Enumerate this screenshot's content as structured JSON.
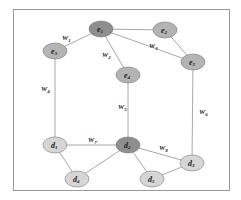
{
  "frame": {
    "x": 13,
    "y": 9,
    "width": 216,
    "height": 181,
    "stroke": "#9a9a9a"
  },
  "colors": {
    "edge": "#a8a8a8",
    "node_dark": "#8e8e8e",
    "node_medium": "#b4b4b4",
    "node_light": "#d6d6d6",
    "node_stroke": "#7a7a7a"
  },
  "nodes": [
    {
      "id": "e1",
      "base": "e",
      "sub": "1",
      "x": 101,
      "y": 29,
      "shade": "dark"
    },
    {
      "id": "e2",
      "base": "e",
      "sub": "2",
      "x": 165,
      "y": 30,
      "shade": "medium"
    },
    {
      "id": "e3",
      "base": "e",
      "sub": "3",
      "x": 55,
      "y": 51,
      "shade": "medium"
    },
    {
      "id": "e4",
      "base": "e",
      "sub": "4",
      "x": 128,
      "y": 75,
      "shade": "medium"
    },
    {
      "id": "e5",
      "base": "e",
      "sub": "5",
      "x": 193,
      "y": 62,
      "shade": "medium"
    },
    {
      "id": "d1",
      "base": "d",
      "sub": "1",
      "x": 55,
      "y": 145,
      "shade": "light"
    },
    {
      "id": "d2",
      "base": "d",
      "sub": "2",
      "x": 128,
      "y": 145,
      "shade": "dark"
    },
    {
      "id": "d3",
      "base": "d",
      "sub": "3",
      "x": 192,
      "y": 163,
      "shade": "light"
    },
    {
      "id": "d4",
      "base": "d",
      "sub": "4",
      "x": 77,
      "y": 179,
      "shade": "light"
    },
    {
      "id": "d5",
      "base": "d",
      "sub": "5",
      "x": 152,
      "y": 179,
      "shade": "light"
    }
  ],
  "edges": [
    {
      "from": "e1",
      "to": "e2",
      "label": null
    },
    {
      "from": "e1",
      "to": "e3",
      "label": {
        "base": "W",
        "sub": "1",
        "x": 62,
        "y": 40
      }
    },
    {
      "from": "e1",
      "to": "e4",
      "label": {
        "base": "W",
        "sub": "2",
        "x": 102,
        "y": 57
      }
    },
    {
      "from": "e1",
      "to": "e5",
      "label": {
        "base": "W",
        "sub": "3",
        "x": 149,
        "y": 48
      }
    },
    {
      "from": "e2",
      "to": "e5",
      "label": null
    },
    {
      "from": "e3",
      "to": "d1",
      "label": {
        "base": "W",
        "sub": "4",
        "x": 41,
        "y": 91
      }
    },
    {
      "from": "e4",
      "to": "d2",
      "label": {
        "base": "W",
        "sub": "5",
        "x": 118,
        "y": 109
      }
    },
    {
      "from": "e5",
      "to": "d3",
      "label": {
        "base": "W",
        "sub": "6",
        "x": 199,
        "y": 114
      }
    },
    {
      "from": "d1",
      "to": "d2",
      "label": {
        "base": "W",
        "sub": "7",
        "x": 88,
        "y": 142
      }
    },
    {
      "from": "d2",
      "to": "d3",
      "label": {
        "base": "W",
        "sub": "8",
        "x": 159,
        "y": 150
      }
    },
    {
      "from": "d1",
      "to": "d4",
      "label": null
    },
    {
      "from": "d4",
      "to": "d2",
      "label": null
    },
    {
      "from": "d2",
      "to": "d5",
      "label": null
    },
    {
      "from": "d5",
      "to": "d3",
      "label": null
    }
  ]
}
